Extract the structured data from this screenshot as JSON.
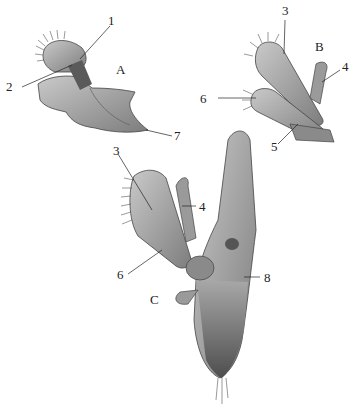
{
  "figure": {
    "panels": [
      {
        "id": "A",
        "label": "A",
        "parts": [
          "1",
          "2",
          "7"
        ]
      },
      {
        "id": "B",
        "label": "B",
        "parts": [
          "3",
          "4",
          "5",
          "6"
        ]
      },
      {
        "id": "C",
        "label": "C",
        "parts": [
          "3",
          "4",
          "6",
          "8"
        ]
      }
    ],
    "labels": {
      "a1": "1",
      "a2": "2",
      "a7": "7",
      "b3": "3",
      "b4": "4",
      "b5": "5",
      "b6": "6",
      "c3": "3",
      "c4": "4",
      "c6": "6",
      "c8": "8"
    },
    "panel_letters": {
      "A": "A",
      "B": "B",
      "C": "C"
    },
    "colors": {
      "ink": "#222222",
      "shade_light": "#b5b5b5",
      "shade_mid": "#8a8a8a",
      "shade_dark": "#555555",
      "background": "#ffffff"
    }
  }
}
